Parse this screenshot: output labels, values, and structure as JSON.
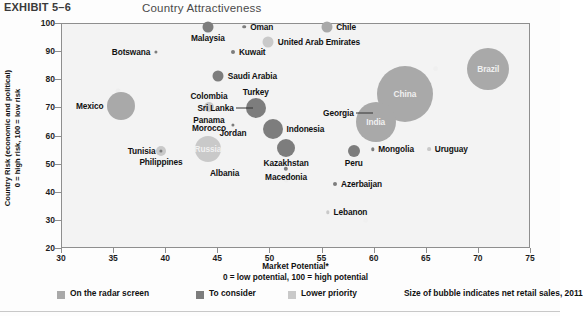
{
  "header": {
    "exhibit_label": "EXHIBIT 5–6",
    "title": "Country Attractiveness"
  },
  "axes": {
    "y_title_line1": "Country Risk (economic and political)",
    "y_title_line2": "0 = high risk, 100 = low risk",
    "x_title_line1": "Market Potential*",
    "x_title_line2": "0 = low potential, 100 = high potential",
    "y_ticks": [
      "100",
      "90",
      "80",
      "70",
      "60",
      "50",
      "40",
      "30",
      "20"
    ],
    "x_ticks": [
      "30",
      "35",
      "40",
      "45",
      "50",
      "55",
      "60",
      "65",
      "70",
      "75"
    ]
  },
  "legend": {
    "items": [
      {
        "label": "On the radar screen",
        "color": "#a9a9a9"
      },
      {
        "label": "To consider",
        "color": "#7d7d7d"
      },
      {
        "label": "Lower priority",
        "color": "#c9c9c9"
      }
    ],
    "note": "Size of bubble indicates net retail sales, 2011"
  },
  "chart_data": {
    "type": "scatter",
    "title": "Country Attractiveness",
    "xlabel": "Market Potential* (0 = low potential, 100 = high potential)",
    "ylabel": "Country Risk (economic and political) 0 = high risk, 100 = low risk",
    "xlim": [
      30,
      75
    ],
    "ylim": [
      20,
      100
    ],
    "grid": false,
    "legend_position": "bottom",
    "size_encodes": "net retail sales, 2011",
    "categories": [
      "On the radar screen",
      "To consider",
      "Lower priority"
    ],
    "points": [
      {
        "name": "Malaysia",
        "x": 44.0,
        "y": 99.0,
        "r": 5.5,
        "group": "To consider",
        "label_pos": "below"
      },
      {
        "name": "Oman",
        "x": 47.5,
        "y": 99.0,
        "r": 1.8,
        "group": "To consider",
        "label_pos": "right"
      },
      {
        "name": "Chile",
        "x": 55.4,
        "y": 99.0,
        "r": 5.5,
        "group": "On the radar screen",
        "label_pos": "right"
      },
      {
        "name": "United Arab Emirates",
        "x": 49.8,
        "y": 93.5,
        "r": 5.5,
        "group": "Lower priority",
        "label_pos": "right"
      },
      {
        "name": "Kuwait",
        "x": 46.4,
        "y": 90.0,
        "r": 2.0,
        "group": "To consider",
        "label_pos": "right"
      },
      {
        "name": "Botswana",
        "x": 39.0,
        "y": 90.0,
        "r": 1.6,
        "group": "To consider",
        "label_pos": "left"
      },
      {
        "name": "Saudi Arabia",
        "x": 45.0,
        "y": 81.5,
        "r": 5.5,
        "group": "To consider",
        "label_pos": "right"
      },
      {
        "name": "Brazil",
        "x": 70.9,
        "y": 84.0,
        "r": 21.0,
        "group": "On the radar screen",
        "label_pos": "inside"
      },
      {
        "name": "Colombia",
        "x": 44.1,
        "y": 70.5,
        "r": 5.0,
        "group": "Lower priority",
        "label_pos": "above"
      },
      {
        "name": "Mexico",
        "x": 35.7,
        "y": 71.0,
        "r": 14.0,
        "group": "On the radar screen",
        "label_pos": "left"
      },
      {
        "name": "Turkey",
        "x": 48.6,
        "y": 70.0,
        "r": 10.0,
        "group": "To consider",
        "label_pos": "above"
      },
      {
        "name": "Sri Lanka",
        "x": 48.6,
        "y": 70.0,
        "r": 0,
        "group": "To consider",
        "label_pos": "leader-left"
      },
      {
        "name": "China",
        "x": 62.9,
        "y": 75.0,
        "r": 28.0,
        "group": "On the radar screen",
        "label_pos": "inside"
      },
      {
        "name": "Panama",
        "x": 44.1,
        "y": 66.0,
        "r": 0,
        "group": "Lower priority",
        "label_pos": "below-stack"
      },
      {
        "name": "Morocco",
        "x": 44.1,
        "y": 63.0,
        "r": 0,
        "group": "Lower priority",
        "label_pos": "below-stack"
      },
      {
        "name": "Jordan",
        "x": 46.4,
        "y": 64.0,
        "r": 1.6,
        "group": "To consider",
        "label_pos": "below"
      },
      {
        "name": "India",
        "x": 60.1,
        "y": 65.0,
        "r": 20.0,
        "group": "On the radar screen",
        "label_pos": "inside"
      },
      {
        "name": "Georgia",
        "x": 60.1,
        "y": 68.5,
        "r": 0,
        "group": "On the radar screen",
        "label_pos": "leader-left"
      },
      {
        "name": "Indonesia",
        "x": 50.2,
        "y": 62.5,
        "r": 10.0,
        "group": "To consider",
        "label_pos": "right"
      },
      {
        "name": "Tunisia",
        "x": 39.5,
        "y": 55.0,
        "r": 1.6,
        "group": "To consider",
        "label_pos": "left"
      },
      {
        "name": "Philippines",
        "x": 39.5,
        "y": 55.0,
        "r": 5.0,
        "group": "Lower priority",
        "label_pos": "below"
      },
      {
        "name": "Russia",
        "x": 44.0,
        "y": 55.5,
        "r": 13.0,
        "group": "Lower priority",
        "label_pos": "inside"
      },
      {
        "name": "Kazakhstan",
        "x": 51.5,
        "y": 56.0,
        "r": 9.0,
        "group": "To consider",
        "label_pos": "below"
      },
      {
        "name": "Mongolia",
        "x": 59.8,
        "y": 55.5,
        "r": 1.7,
        "group": "To consider",
        "label_pos": "right"
      },
      {
        "name": "Peru",
        "x": 58.0,
        "y": 55.0,
        "r": 6.0,
        "group": "To consider",
        "label_pos": "below"
      },
      {
        "name": "Uruguay",
        "x": 65.2,
        "y": 55.5,
        "r": 1.9,
        "group": "Lower priority",
        "label_pos": "right"
      },
      {
        "name": "Albania",
        "x": 45.6,
        "y": 47.0,
        "r": 0,
        "group": "To consider",
        "label_pos": "center"
      },
      {
        "name": "Macedonia",
        "x": 51.5,
        "y": 48.5,
        "r": 2.2,
        "group": "To consider",
        "label_pos": "below"
      },
      {
        "name": "Azerbaijan",
        "x": 56.2,
        "y": 43.0,
        "r": 2.0,
        "group": "To consider",
        "label_pos": "right"
      },
      {
        "name": "Lebanon",
        "x": 55.5,
        "y": 33.0,
        "r": 1.7,
        "group": "Lower priority",
        "label_pos": "right"
      }
    ]
  }
}
